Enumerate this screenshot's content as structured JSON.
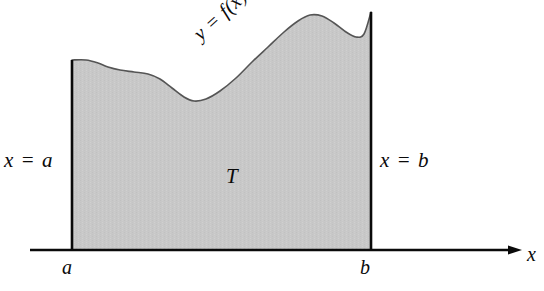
{
  "figure": {
    "type": "calculus-area-under-curve-diagram",
    "background_color": "#ffffff",
    "ink_color": "#0a0a0a",
    "region_fill_color": "#c8c8c8"
  },
  "labels": {
    "left_boundary": "x = a",
    "right_boundary": "x = b",
    "region": "T",
    "curve": "y = f(x)",
    "tick_a": "a",
    "tick_b": "b",
    "axis_x": "x"
  },
  "chart_data": {
    "type": "area",
    "title": "",
    "xlabel": "x",
    "ylabel": "",
    "grid": false,
    "legend": null,
    "annotations": [
      {
        "text": "y = f(x)",
        "role": "curve-label",
        "x": 255,
        "y": 40,
        "rotation_deg": -42
      },
      {
        "text": "T",
        "role": "region-label",
        "x": 233,
        "y": 178
      },
      {
        "text": "x = a",
        "role": "left-boundary-label",
        "x": 34,
        "y": 162
      },
      {
        "text": "x = b",
        "role": "right-boundary-label",
        "x": 410,
        "y": 162
      },
      {
        "text": "a",
        "role": "x-tick-label",
        "x": 68,
        "y": 267
      },
      {
        "text": "b",
        "role": "x-tick-label",
        "x": 366,
        "y": 267
      },
      {
        "text": "x",
        "role": "axis-label",
        "x": 532,
        "y": 254
      }
    ],
    "axis": {
      "x_axis_pixel_y": 250,
      "x_axis_start_x": 30,
      "x_axis_end_x": 522,
      "arrow_at_end": true
    },
    "boundaries": {
      "a_pixel_x": 72,
      "b_pixel_x": 371,
      "a_curve_top_y": 60,
      "b_curve_top_y": 12
    },
    "curve_points": [
      [
        72,
        60
      ],
      [
        86,
        60
      ],
      [
        98,
        63
      ],
      [
        108,
        67
      ],
      [
        120,
        70
      ],
      [
        134,
        72
      ],
      [
        148,
        74
      ],
      [
        160,
        79
      ],
      [
        172,
        88
      ],
      [
        184,
        97
      ],
      [
        194,
        101
      ],
      [
        206,
        99
      ],
      [
        220,
        91
      ],
      [
        236,
        78
      ],
      [
        252,
        62
      ],
      [
        268,
        47
      ],
      [
        284,
        32
      ],
      [
        298,
        21
      ],
      [
        310,
        15
      ],
      [
        322,
        16
      ],
      [
        334,
        23
      ],
      [
        346,
        32
      ],
      [
        356,
        37
      ],
      [
        364,
        34
      ],
      [
        371,
        12
      ]
    ]
  }
}
